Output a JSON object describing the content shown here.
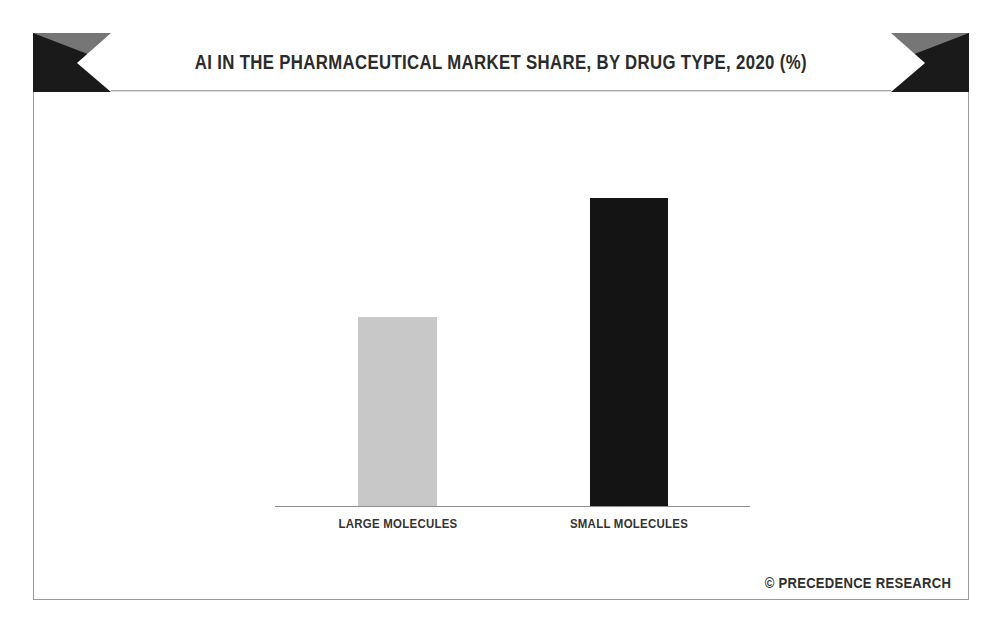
{
  "chart_data": {
    "type": "bar",
    "title": "AI IN THE PHARMACEUTICAL MARKET SHARE, BY DRUG TYPE, 2020 (%)",
    "categories": [
      "LARGE MOLECULES",
      "SMALL MOLECULES"
    ],
    "values": [
      38,
      62
    ],
    "xlabel": "",
    "ylabel": "",
    "ylim": [
      0,
      70
    ],
    "grid": false,
    "legend": "none",
    "axis_tick_labels": [],
    "series": [
      {
        "name": "Market share (%)",
        "values": [
          38,
          62
        ]
      }
    ],
    "bar_colors": [
      "#c8c8c8",
      "#141414"
    ],
    "units": "%"
  },
  "banner": {
    "title": "AI IN THE PHARMACEUTICAL MARKET SHARE, BY DRUG TYPE, 2020 (%)",
    "accent_dark": "#1a1a1a",
    "accent_gray": "#767676",
    "background": "#ffffff"
  },
  "bars": [
    {
      "label": "LARGE MOLECULES",
      "value": 38,
      "color": "#c8c8c8"
    },
    {
      "label": "SMALL MOLECULES",
      "value": 62,
      "color": "#141414"
    }
  ],
  "footer": {
    "credit": "© PRECEDENCE RESEARCH"
  },
  "colors": {
    "frame_border": "#9a9a9a",
    "axis_line": "#8e8e8e",
    "title_text": "#2b2b2b",
    "label_text": "#333333"
  }
}
